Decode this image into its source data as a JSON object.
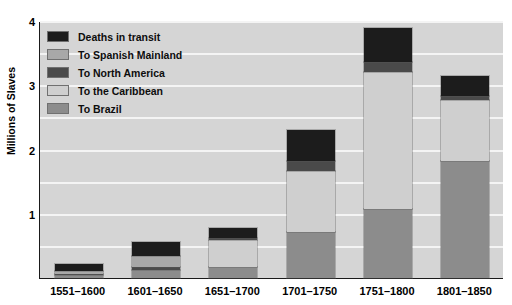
{
  "chart_data": {
    "type": "bar",
    "subtype": "stacked-bar",
    "title": "",
    "xlabel": "",
    "ylabel": "Millions of Slaves",
    "ylim": [
      0,
      4
    ],
    "yticks": [
      1,
      2,
      3,
      4
    ],
    "ytick_labels": [
      "1",
      "2",
      "3",
      "4"
    ],
    "grid": true,
    "grid_axis": "y",
    "legend_position": "upper left inside plot",
    "categories": [
      "1551–1600",
      "1601–1650",
      "1651–1700",
      "1701–1750",
      "1751–1800",
      "1801–1850"
    ],
    "stack_order_bottom_to_top": [
      "To Brazil",
      "To the Caribbean",
      "To North America",
      "To Spanish Mainland",
      "Deaths in transit"
    ],
    "series": [
      {
        "name": "To Brazil",
        "color": "#8c8c8c",
        "values": [
          0.05,
          0.12,
          0.17,
          0.72,
          1.08,
          1.82
        ]
      },
      {
        "name": "To the Caribbean",
        "color": "#cfcfcf",
        "values": [
          0.0,
          0.0,
          0.42,
          0.95,
          2.12,
          0.95
        ]
      },
      {
        "name": "To North America",
        "color": "#4a4a4a",
        "values": [
          0.02,
          0.05,
          0.04,
          0.15,
          0.16,
          0.07
        ]
      },
      {
        "name": "To Spanish Mainland",
        "color": "#a8a8a8",
        "values": [
          0.04,
          0.17,
          0.0,
          0.0,
          0.0,
          0.0
        ]
      },
      {
        "name": "Deaths in transit",
        "color": "#1c1c1c",
        "values": [
          0.11,
          0.22,
          0.15,
          0.48,
          0.53,
          0.3
        ]
      }
    ],
    "totals": [
      0.22,
      0.56,
      0.78,
      2.3,
      3.89,
      3.14
    ]
  },
  "axes": {
    "y_title": "Millions of Slaves",
    "y_ticks": [
      {
        "label": "4",
        "value": 4
      },
      {
        "label": "3",
        "value": 3
      },
      {
        "label": "2",
        "value": 2
      },
      {
        "label": "1",
        "value": 1
      }
    ],
    "x_ticks": [
      {
        "label": "1551–1600"
      },
      {
        "label": "1601–1650"
      },
      {
        "label": "1651–1700"
      },
      {
        "label": "1701–1750"
      },
      {
        "label": "1751–1800"
      },
      {
        "label": "1801–1850"
      }
    ]
  },
  "legend": {
    "items": [
      {
        "label": "Deaths in transit",
        "color": "#1c1c1c"
      },
      {
        "label": "To Spanish Mainland",
        "color": "#a8a8a8"
      },
      {
        "label": "To North America",
        "color": "#4a4a4a"
      },
      {
        "label": "To the Caribbean",
        "color": "#cfcfcf"
      },
      {
        "label": "To Brazil",
        "color": "#8c8c8c"
      }
    ]
  },
  "style": {
    "plot_background": "#d5d5d5",
    "page_background": "#ffffff",
    "gridline_color": "#f4f4f4",
    "axis_color": "#1a1a1a"
  }
}
